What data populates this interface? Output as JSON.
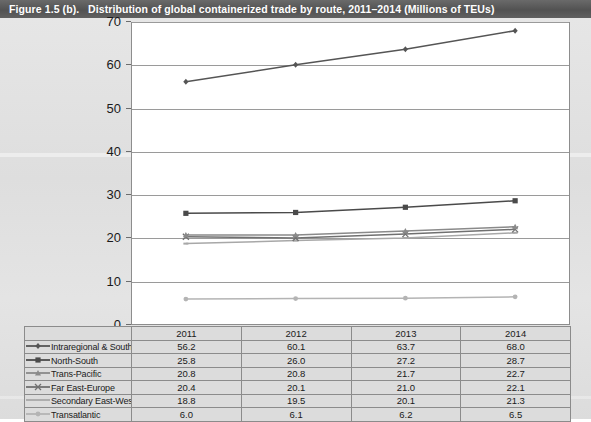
{
  "figure": {
    "number": "Figure 1.5 (b).",
    "title": "Distribution of global containerized trade by route, 2011–2014 (Millions of TEUs)"
  },
  "chart_data": {
    "type": "line",
    "title": "Distribution of global containerized trade by route, 2011–2014 (Millions of TEUs)",
    "xlabel": "",
    "ylabel": "",
    "categories": [
      "2011",
      "2012",
      "2013",
      "2014"
    ],
    "ylim": [
      0,
      70
    ],
    "yticks": [
      0,
      10,
      20,
      30,
      40,
      50,
      60,
      70
    ],
    "ytick_labels": [
      "0",
      "10",
      "20",
      "30",
      "40",
      "50",
      "60",
      "70"
    ],
    "grid": true,
    "legend_position": "table-below",
    "series": [
      {
        "name": "Intraregional & South-South",
        "values": [
          56.2,
          60.1,
          63.7,
          68.0
        ],
        "color": "#555555",
        "marker": "diamond"
      },
      {
        "name": "North-South",
        "values": [
          25.8,
          26.0,
          27.2,
          28.7
        ],
        "color": "#4a4a4a",
        "marker": "square"
      },
      {
        "name": "Trans-Pacific",
        "values": [
          20.8,
          20.8,
          21.7,
          22.7
        ],
        "color": "#8a8a8a",
        "marker": "triangle"
      },
      {
        "name": "Far East-Europe",
        "values": [
          20.4,
          20.1,
          21.0,
          22.1
        ],
        "color": "#707070",
        "marker": "cross"
      },
      {
        "name": "Secondary East-West",
        "values": [
          18.8,
          19.5,
          20.1,
          21.3
        ],
        "color": "#a8a8a8",
        "marker": "line"
      },
      {
        "name": "Transatlantic",
        "values": [
          6.0,
          6.1,
          6.2,
          6.5
        ],
        "color": "#b4b4b4",
        "marker": "circle"
      }
    ]
  },
  "table": {
    "year_headers": [
      "2011",
      "2012",
      "2013",
      "2014"
    ],
    "rows": [
      {
        "label": "Intraregional & South-South",
        "marker": "diamond-marker",
        "values": [
          "56.2",
          "60.1",
          "63.7",
          "68.0"
        ]
      },
      {
        "label": "North-South",
        "marker": "square-marker",
        "values": [
          "25.8",
          "26.0",
          "27.2",
          "28.7"
        ]
      },
      {
        "label": "Trans-Pacific",
        "marker": "triangle-marker",
        "values": [
          "20.8",
          "20.8",
          "21.7",
          "22.7"
        ]
      },
      {
        "label": "Far East-Europe",
        "marker": "cross-marker",
        "values": [
          "20.4",
          "20.1",
          "21.0",
          "22.1"
        ]
      },
      {
        "label": "Secondary East-West",
        "marker": "line-marker",
        "values": [
          "18.8",
          "19.5",
          "20.1",
          "21.3"
        ]
      },
      {
        "label": "Transatlantic",
        "marker": "circle-marker",
        "values": [
          "6.0",
          "6.1",
          "6.2",
          "6.5"
        ]
      }
    ]
  }
}
